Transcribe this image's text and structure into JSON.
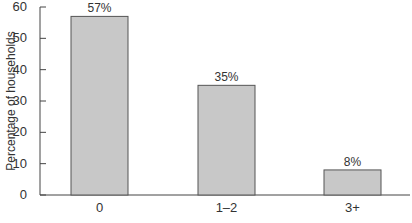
{
  "chart_data": {
    "type": "bar",
    "title": "",
    "xlabel": "",
    "ylabel": "Percentage of households",
    "categories": [
      "0",
      "1–2",
      "3+"
    ],
    "values": [
      57,
      35,
      8
    ],
    "value_labels": [
      "57%",
      "35%",
      "8%"
    ],
    "ylim": [
      0,
      60
    ],
    "yticks": [
      0,
      10,
      20,
      30,
      40,
      50,
      60
    ],
    "grid": false,
    "legend": null,
    "bar_color": "#c8c8c8",
    "bar_edge_color": "#555555"
  }
}
